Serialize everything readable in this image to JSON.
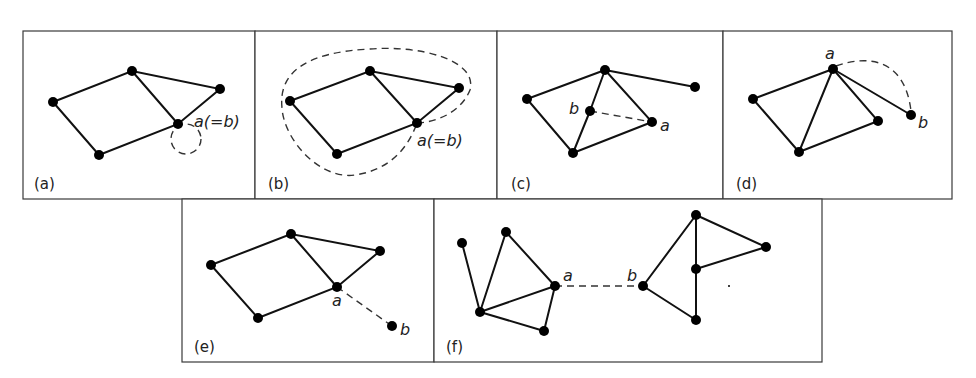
{
  "figure": {
    "panels": [
      {
        "id": "a",
        "label": "(a)",
        "vertex_label": "a(=b)",
        "description": "self-loop at vertex a"
      },
      {
        "id": "b",
        "label": "(b)",
        "vertex_label": "a(=b)",
        "description": "closed walk enclosing graph from a back to a"
      },
      {
        "id": "c",
        "label": "(c)",
        "vertex_labels": [
          "a",
          "b"
        ],
        "description": "dashed edge between interior vertices a and b"
      },
      {
        "id": "d",
        "label": "(d)",
        "vertex_labels": [
          "a",
          "b"
        ],
        "description": "dashed arc from a to pendant vertex b"
      },
      {
        "id": "e",
        "label": "(e)",
        "vertex_labels": [
          "a",
          "b"
        ],
        "description": "dashed edge from a to new vertex b"
      },
      {
        "id": "f",
        "label": "(f)",
        "vertex_labels": [
          "a",
          "b"
        ],
        "description": "dashed edge joining two components at a and b"
      }
    ]
  },
  "labels": {
    "a": {
      "panel": "(a)",
      "vertex": "a(=b)"
    },
    "b": {
      "panel": "(b)",
      "vertex": "a(=b)"
    },
    "c": {
      "panel": "(c)",
      "va": "a",
      "vb": "b"
    },
    "d": {
      "panel": "(d)",
      "va": "a",
      "vb": "b"
    },
    "e": {
      "panel": "(e)",
      "va": "a",
      "vb": "b"
    },
    "f": {
      "panel": "(f)",
      "va": "a",
      "vb": "b"
    }
  },
  "colors": {
    "line": "#111111",
    "border": "#3a3a3a",
    "background": "#ffffff"
  }
}
